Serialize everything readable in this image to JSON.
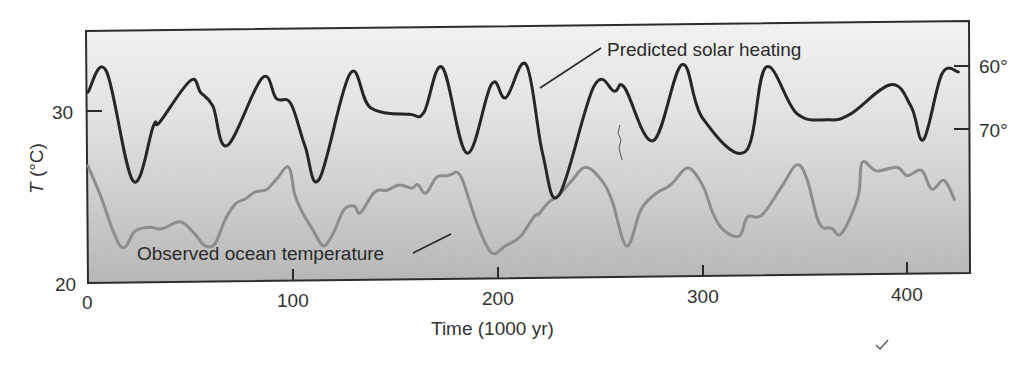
{
  "chart_data": {
    "type": "line",
    "title": "",
    "xlabel": "Time (1000 yr)",
    "ylabel": "T (°C)",
    "ylabel_italic_part": "T",
    "ylabel_rest": " (°C)",
    "xlim": [
      0,
      430
    ],
    "ylim_left": [
      20,
      35
    ],
    "x_ticks": [
      0,
      100,
      200,
      300,
      400
    ],
    "x_tick_labels": [
      "0",
      "100",
      "200",
      "300",
      "400"
    ],
    "y_ticks_left": [
      20,
      30
    ],
    "y_tick_labels_left": [
      "20",
      "30"
    ],
    "y_ticks_right_labels": [
      "60°",
      "70°"
    ],
    "y_axis_right_description": "Latitude of solar heating (inverted, 60° above 70°)",
    "grid": false,
    "legend": "none (inline annotations with leader lines)",
    "series": [
      {
        "name": "Predicted solar heating",
        "color": "#262626",
        "axis": "right",
        "x": [
          0,
          9,
          22,
          32,
          35,
          50,
          55,
          61,
          68,
          85,
          92,
          99,
          106,
          113,
          128,
          138,
          157,
          164,
          173,
          185,
          197,
          204,
          214,
          222,
          230,
          247,
          257,
          262,
          276,
          290,
          300,
          321,
          331,
          346,
          361,
          372,
          392,
          402,
          408,
          417,
          425
        ],
        "y": [
          31.1,
          32.3,
          25.9,
          29.1,
          29.3,
          31.7,
          31.0,
          30.2,
          27.9,
          31.8,
          30.6,
          30.3,
          27.8,
          25.9,
          32.0,
          30.0,
          29.6,
          29.7,
          32.3,
          27.3,
          31.3,
          30.5,
          32.4,
          27.2,
          24.8,
          31.1,
          30.8,
          31.0,
          27.9,
          32.3,
          29.2,
          27.2,
          32.1,
          29.4,
          29.0,
          29.3,
          31.0,
          29.7,
          27.8,
          31.6,
          31.7
        ]
      },
      {
        "name": "Observed ocean temperature",
        "color": "#8a8a8a",
        "axis": "left",
        "x": [
          0,
          6,
          16,
          23,
          30,
          36,
          45,
          52,
          57,
          62,
          67,
          72,
          77,
          82,
          87,
          92,
          98,
          101,
          105,
          110,
          115,
          120,
          125,
          130,
          133,
          140,
          146,
          152,
          158,
          161,
          165,
          170,
          175,
          178,
          180,
          183,
          190,
          197,
          204,
          211,
          218,
          220,
          225,
          230,
          236,
          243,
          251,
          256,
          263,
          270,
          277,
          283,
          286,
          293,
          300,
          305,
          310,
          318,
          322,
          329,
          339,
          346,
          351,
          357,
          363,
          368,
          376,
          378,
          385,
          395,
          400,
          407,
          412,
          418,
          423
        ],
        "y": [
          26.8,
          25.1,
          22.1,
          23.0,
          23.2,
          23.1,
          23.5,
          22.8,
          22.1,
          22.2,
          23.6,
          24.5,
          24.8,
          25.2,
          25.3,
          25.9,
          26.6,
          25.0,
          23.9,
          22.9,
          22.0,
          22.8,
          24.1,
          24.3,
          23.9,
          25.1,
          25.2,
          25.5,
          25.3,
          25.5,
          25.0,
          25.9,
          26.0,
          26.1,
          26.2,
          25.7,
          23.2,
          21.5,
          21.9,
          22.4,
          23.6,
          23.7,
          24.4,
          24.8,
          25.6,
          26.4,
          25.6,
          24.4,
          21.8,
          23.9,
          24.8,
          25.2,
          25.5,
          26.3,
          25.3,
          23.7,
          22.7,
          22.3,
          23.4,
          23.5,
          25.2,
          26.4,
          25.6,
          23.0,
          22.7,
          22.4,
          24.5,
          26.5,
          26.0,
          26.2,
          25.7,
          26.0,
          24.9,
          25.4,
          24.3
        ]
      }
    ],
    "annotations": [
      {
        "text": "Predicted solar heating",
        "target_series": "Predicted solar heating"
      },
      {
        "text": "Observed ocean temperature",
        "target_series": "Observed ocean temperature"
      }
    ],
    "background": "vertical gradient, light gray (#f2f2f2) at top to mid gray (#b9b9b9) at bottom"
  },
  "labels": {
    "x_axis_title": "Time (1000 yr)",
    "y_axis_title_italic": "T",
    "y_axis_title_rest": " (°C)",
    "left_tick_30": "30",
    "left_tick_20": "20",
    "right_tick_60": "60°",
    "right_tick_70": "70°",
    "x_tick_0": "0",
    "x_tick_100": "100",
    "x_tick_200": "200",
    "x_tick_300": "300",
    "x_tick_400": "400",
    "annot_solar": "Predicted solar heating",
    "annot_ocean": "Observed ocean temperature"
  },
  "colors": {
    "solar_line": "#262626",
    "ocean_line": "#8d8d8d",
    "frame": "#2b2b2b",
    "bg_top": "#f3f3f3",
    "bg_bottom": "#b8b8b8"
  }
}
